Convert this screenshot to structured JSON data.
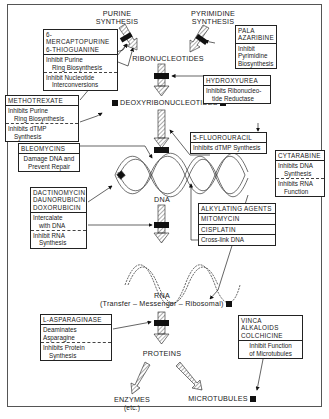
{
  "diagram": {
    "nodes": {
      "purine_synthesis": "PURINE\nSYNTHESIS",
      "pyrimidine_synthesis": "PYRIMIDINE\nSYNTHESIS",
      "ribonucleotides": "RIBONUCLEOTIDES",
      "deoxyribonucleotides": "DEOXYRIBONUCLEOTIDES",
      "dna": "DNA",
      "rna": "RNA",
      "rna_types": "(Transfer – Messenger – Ribosomal)",
      "proteins": "PROTEINS",
      "enzymes": "ENZYMES",
      "enzymes_sub": "(etc.)",
      "microtubules": "MICROTUBULES"
    },
    "drug_boxes": {
      "mercaptopurine": {
        "drugs": [
          "6-MERCAPTOPURINE",
          "6-THIOGUANINE"
        ],
        "effects": [
          [
            "Inhibit Purine",
            "Ring Biosynthesis"
          ],
          [
            "Inhibit Nucleotide",
            "Interconversions"
          ]
        ]
      },
      "pala": {
        "drugs": [
          "PALA",
          "AZARIBINE"
        ],
        "effects": [
          [
            "Inhibit",
            "Pyrimidine",
            "Biosynthesis"
          ]
        ]
      },
      "hydroxyurea": {
        "drugs": [
          "HYDROXYUREA"
        ],
        "effects": [
          [
            "Inhibits Ribonucleo-",
            "tide Reductase"
          ]
        ]
      },
      "methotrexate": {
        "drugs": [
          "METHOTREXATE"
        ],
        "effects": [
          [
            "Inhibits Purine",
            "Ring Biosynthesis"
          ],
          [
            "Inhibits dTMP",
            "Synthesis"
          ]
        ]
      },
      "fluorouracil": {
        "drugs": [
          "5-FLUOROURACIL"
        ],
        "effects": [
          [
            "Inhibits dTMP Synthesis"
          ]
        ]
      },
      "bleomycins": {
        "drugs": [
          "BLEOMYCINS"
        ],
        "effects": [
          [
            "Damage DNA and",
            "Prevent Repair"
          ]
        ]
      },
      "cytarabine": {
        "drugs": [
          "CYTARABINE"
        ],
        "effects": [
          [
            "Inhibits DNA",
            "Synthesis"
          ],
          [
            "Inhibits RNA",
            "Function"
          ]
        ]
      },
      "dactinomycin": {
        "drugs": [
          "DACTINOMYCIN",
          "DAUNORUBICIN",
          "DOXORUBICIN"
        ],
        "effects": [
          [
            "Intercalate",
            "with DNA"
          ],
          [
            "Inhibit RNA",
            "Synthesis"
          ]
        ]
      },
      "alkylating": {
        "drugs": [
          "ALKYLATING AGENTS",
          "MITOMYCIN",
          "CISPLATIN"
        ],
        "effects": [
          [
            "Cross-link DNA"
          ]
        ]
      },
      "asparaginase": {
        "drugs": [
          "L-ASPARAGINASE"
        ],
        "effects": [
          [
            "Deaminates Asparagine"
          ],
          [
            "Inhibits Protein",
            "Synthesis"
          ]
        ]
      },
      "vinca": {
        "drugs": [
          "VINCA ALKALOIDS",
          "COLCHICINE"
        ],
        "effects": [
          [
            "Inhibit Function",
            "of Microtubules"
          ]
        ]
      }
    },
    "colors": {
      "ink": "#1a1a1a",
      "background": "#ffffff",
      "border": "#555555"
    }
  }
}
